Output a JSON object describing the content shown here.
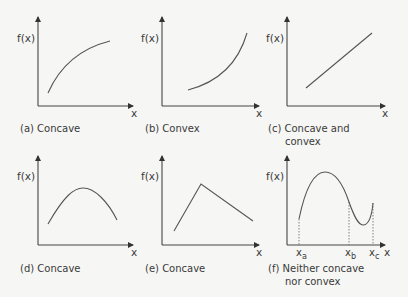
{
  "panels": [
    {
      "id": "a",
      "caption": "(a) Concave",
      "caption2": "",
      "ylabel": "f(x)",
      "xlabel": "x"
    },
    {
      "id": "b",
      "caption": "(b) Convex",
      "caption2": "",
      "ylabel": "f(x)",
      "xlabel": "x"
    },
    {
      "id": "c",
      "caption": "(c) Concave and",
      "caption2": "convex",
      "ylabel": "f(x)",
      "xlabel": "x"
    },
    {
      "id": "d",
      "caption": "(d) Concave",
      "caption2": "",
      "ylabel": "f(x)",
      "xlabel": "x"
    },
    {
      "id": "e",
      "caption": "(e) Concave",
      "caption2": "",
      "ylabel": "f(x)",
      "xlabel": "x"
    },
    {
      "id": "f",
      "caption": "(f) Neither concave",
      "caption2": "nor convex",
      "ylabel": "f(x)",
      "xlabel": "x",
      "ticks": [
        {
          "base": "x",
          "sub": "a"
        },
        {
          "base": "x",
          "sub": "b"
        },
        {
          "base": "x",
          "sub": "c"
        }
      ]
    }
  ],
  "colors": {
    "line": "#4a4a4a",
    "background": "#f6f6f4"
  }
}
